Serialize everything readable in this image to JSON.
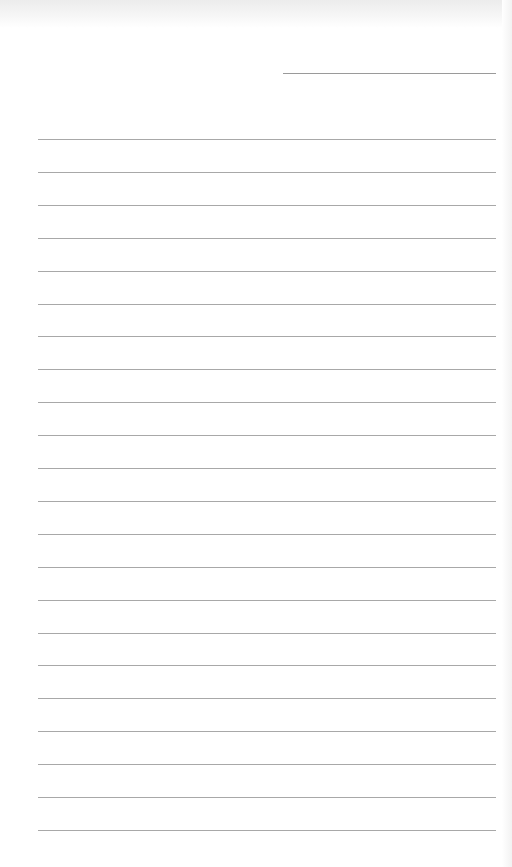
{
  "document": {
    "type": "blank lined paper",
    "date_line": {
      "top": 73,
      "left": 283,
      "width": 213
    },
    "rules": {
      "count": 22,
      "first_top": 139,
      "spacing": 32.9,
      "left": 38,
      "width": 458
    },
    "colors": {
      "paper": "#ffffff",
      "rule": "#a8a8a8",
      "scan_band": "#ececec"
    }
  }
}
